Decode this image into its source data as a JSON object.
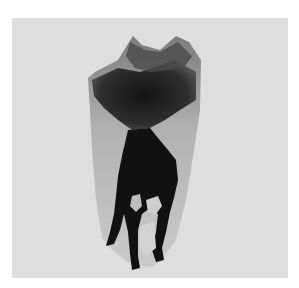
{
  "image": {
    "subject": "radiograph of a molar tooth",
    "colors": {
      "page_background": "#ffffff",
      "panel_background": "#dedede",
      "tooth_translucent": "#b5b5b5",
      "tooth_dark": "#1a1a1a"
    }
  }
}
